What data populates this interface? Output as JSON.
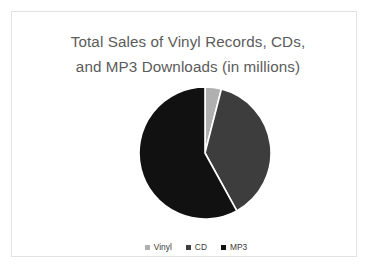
{
  "slide": {
    "background_color": "#ffffff",
    "border_color": "#e2e2e2"
  },
  "title": {
    "line1": "Total Sales of Vinyl Records, CDs,",
    "line2": "and MP3 Downloads (in millions)",
    "color": "#5b5b5b"
  },
  "chart_data": {
    "type": "pie",
    "title": "Total Sales of Vinyl Records, CDs, and MP3 Downloads (in millions)",
    "xlabel": "",
    "ylabel": "",
    "categories": [
      "Vinyl",
      "CD",
      "MP3"
    ],
    "values": [
      4,
      38,
      58
    ],
    "unit": "percent",
    "colors": [
      "#b0b0b0",
      "#3d3d3d",
      "#111111"
    ],
    "separator_color": "#ffffff",
    "start_angle_deg": 0,
    "direction": "clockwise",
    "legend_position": "bottom",
    "grid": false,
    "slices": [
      {
        "label": "Vinyl",
        "value": 4,
        "color": "#b0b0b0"
      },
      {
        "label": "CD",
        "value": 38,
        "color": "#3d3d3d"
      },
      {
        "label": "MP3",
        "value": 58,
        "color": "#111111"
      }
    ]
  },
  "legend": {
    "items": [
      {
        "label": "Vinyl",
        "color": "#b0b0b0"
      },
      {
        "label": "CD",
        "color": "#3d3d3d"
      },
      {
        "label": "MP3",
        "color": "#111111"
      }
    ]
  }
}
